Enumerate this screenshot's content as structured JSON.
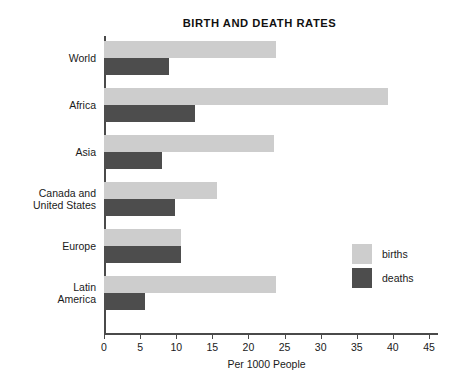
{
  "chart_data": {
    "type": "bar",
    "orientation": "horizontal",
    "title": "BIRTH AND DEATH RATES",
    "xlabel": "Per 1000 People",
    "ylabel": "",
    "xlim": [
      0,
      45
    ],
    "xticks": [
      0,
      5,
      10,
      15,
      20,
      25,
      30,
      35,
      40,
      45
    ],
    "xtick_labels": [
      "0",
      "5",
      "10",
      "15",
      "20",
      "25",
      "30",
      "35",
      "40",
      "45"
    ],
    "grid": false,
    "legend_position": "right",
    "categories": [
      "World",
      "Africa",
      "Asia",
      "Canada and\nUnited States",
      "Europe",
      "Latin\nAmerica"
    ],
    "series": [
      {
        "name": "births",
        "color": "#cdcdcd",
        "values": [
          23.8,
          39.3,
          23.5,
          15.7,
          10.7,
          23.8
        ]
      },
      {
        "name": "deaths",
        "color": "#4d4d4d",
        "values": [
          9.0,
          12.6,
          8.0,
          9.8,
          10.7,
          5.7
        ]
      }
    ]
  },
  "legend": {
    "items": [
      {
        "label": "births",
        "color": "#cdcdcd"
      },
      {
        "label": "deaths",
        "color": "#4d4d4d"
      }
    ]
  }
}
